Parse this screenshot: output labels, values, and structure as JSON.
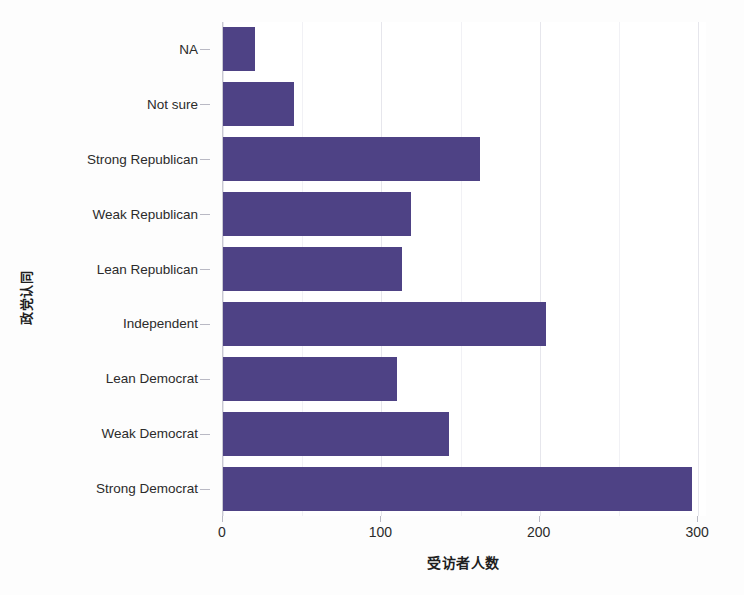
{
  "chart_data": {
    "type": "bar",
    "orientation": "horizontal",
    "title": "",
    "xlabel": "受访者人数",
    "ylabel": "政党认同",
    "categories": [
      "NA",
      "Not sure",
      "Strong Republican",
      "Weak Republican",
      "Lean Republican",
      "Independent",
      "Lean Democrat",
      "Weak Democrat",
      "Strong Democrat"
    ],
    "values": [
      20,
      45,
      162,
      119,
      113,
      204,
      110,
      143,
      296
    ],
    "xlim": [
      0,
      305
    ],
    "xticks": [
      0,
      100,
      200,
      300
    ],
    "xtick_labels": [
      "0",
      "100",
      "200",
      "300"
    ],
    "grid": true,
    "grid_axis": "x",
    "legend": "none",
    "bar_color": "#4e4285",
    "panel_background": "#ffffff",
    "grid_color": "#e6e6ec"
  }
}
